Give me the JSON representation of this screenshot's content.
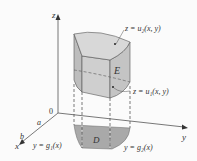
{
  "diagram": {
    "axes": {
      "x": "x",
      "y": "y",
      "z": "z",
      "origin": "0"
    },
    "x_ticks": [
      "a",
      "b"
    ],
    "labels": {
      "top_surface": "z = u₂(x, y)",
      "bottom_surface": "z = u₁(x, y)",
      "solid": "E",
      "region": "D",
      "lower_curve": "y = g₁(x)",
      "upper_curve": "y = g₂(x)"
    },
    "colors": {
      "solid_fill": "#c9c9c9",
      "solid_top": "#d6d6d6",
      "region_fill": "#a9a9a9",
      "line": "#444444"
    }
  }
}
